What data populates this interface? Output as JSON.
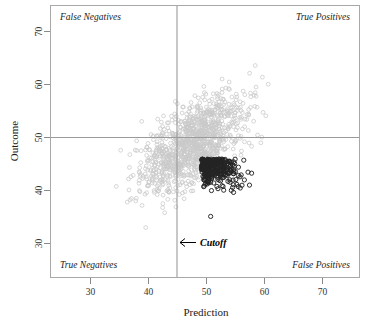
{
  "chart_data": {
    "type": "scatter",
    "title": "",
    "xlabel": "Prediction",
    "ylabel": "Outcome",
    "xlim": [
      24,
      76
    ],
    "ylim": [
      25,
      76
    ],
    "xticks": [
      30,
      40,
      50,
      60,
      70
    ],
    "yticks": [
      30,
      40,
      50,
      60,
      70
    ],
    "grid": false,
    "legend": "none",
    "reference_lines": [
      {
        "name": "cutoff-vertical",
        "orientation": "vertical",
        "value": 45,
        "label": "Cutoff"
      },
      {
        "name": "outcome-horizontal",
        "orientation": "horizontal",
        "value": 50,
        "label": ""
      }
    ],
    "annotations": [
      {
        "name": "cutoff",
        "text": "Cutoff",
        "arrow": "←",
        "x": 46.5,
        "y": 31
      },
      {
        "name": "false-negatives",
        "text": "False Negatives",
        "quadrant": "top-left"
      },
      {
        "name": "true-positives",
        "text": "True Positives",
        "quadrant": "top-right"
      },
      {
        "name": "true-negatives",
        "text": "True Negatives",
        "quadrant": "bottom-left"
      },
      {
        "name": "false-positives",
        "text": "False Positives",
        "quadrant": "bottom-right"
      }
    ],
    "series": [
      {
        "name": "all-cases",
        "marker": "open-circle",
        "color": "#c9c9c9",
        "count": 1100,
        "distribution": {
          "mean_x": 48.0,
          "mean_y": 50.0,
          "sd_x": 4.2,
          "sd_y": 4.6,
          "correlation": 0.62
        }
      },
      {
        "name": "selected-below-cutoff",
        "marker": "open-circle",
        "color": "#242424",
        "count": 340,
        "region": "x > 45 and y < 50",
        "distribution": {
          "mean_x": 49.0,
          "mean_y": 47.2,
          "sd_x": 3.0,
          "sd_y": 2.3,
          "correlation": 0.35
        }
      }
    ]
  },
  "axes": {
    "x": {
      "title": "Prediction",
      "tick_labels": [
        "30",
        "40",
        "50",
        "60",
        "70"
      ]
    },
    "y": {
      "title": "Outcome",
      "tick_labels": [
        "30",
        "40",
        "50",
        "60",
        "70"
      ]
    }
  },
  "labels": {
    "false_negatives": "False Negatives",
    "true_positives": "True Positives",
    "true_negatives": "True Negatives",
    "false_positives": "False Positives",
    "cutoff": "Cutoff",
    "cutoff_arrow": "←"
  },
  "colors": {
    "background": "#ffffff",
    "frame": "#a8a8a8",
    "reference_line": "#9a9a9a",
    "cloud_points": "#c9c9c9",
    "highlight_points": "#242424",
    "text": "#1a1a1a"
  }
}
